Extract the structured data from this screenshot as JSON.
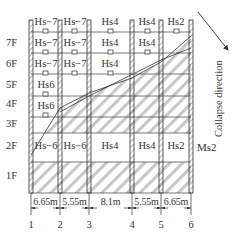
{
  "figure": {
    "collapse_label": "Collapse direction",
    "ms_label": "Ms2",
    "floors": [
      {
        "label": "7F",
        "y": 37
      },
      {
        "label": "6F",
        "y": 58
      },
      {
        "label": "5F",
        "y": 79
      },
      {
        "label": "4F",
        "y": 98
      },
      {
        "label": "3F",
        "y": 118
      },
      {
        "label": "2F",
        "y": 140
      },
      {
        "label": "1F",
        "y": 170
      }
    ],
    "axes": [
      {
        "label": "1",
        "x": 31
      },
      {
        "label": "2",
        "x": 60
      },
      {
        "label": "3",
        "x": 89
      },
      {
        "label": "4",
        "x": 132
      },
      {
        "label": "5",
        "x": 161
      },
      {
        "label": "6",
        "x": 191
      }
    ],
    "spans": [
      {
        "label": "6.65m",
        "x": 45.5
      },
      {
        "label": "5.55m",
        "x": 74.5
      },
      {
        "label": "8.1m",
        "x": 110.5
      },
      {
        "label": "5.55m",
        "x": 146.5
      },
      {
        "label": "6.65m",
        "x": 176
      }
    ],
    "rooms": [
      {
        "label": "Hs−7",
        "x": 46,
        "y": 16
      },
      {
        "label": "Hs−7",
        "x": 75,
        "y": 16
      },
      {
        "label": "Hs4",
        "x": 110,
        "y": 16
      },
      {
        "label": "Hs4",
        "x": 147,
        "y": 16
      },
      {
        "label": "Hs2",
        "x": 176,
        "y": 16
      },
      {
        "label": "Hs−7",
        "x": 46,
        "y": 37
      },
      {
        "label": "Hs−7",
        "x": 75,
        "y": 37
      },
      {
        "label": "Hs4",
        "x": 110,
        "y": 37
      },
      {
        "label": "Hs4",
        "x": 147,
        "y": 37
      },
      {
        "label": "Hs−7",
        "x": 46,
        "y": 58
      },
      {
        "label": "Hs−7",
        "x": 75,
        "y": 58
      },
      {
        "label": "Hs4",
        "x": 110,
        "y": 58
      },
      {
        "label": "Hs6",
        "x": 46,
        "y": 79
      },
      {
        "label": "Hs6",
        "x": 46,
        "y": 100
      },
      {
        "label": "Hs−6",
        "x": 46,
        "y": 140
      },
      {
        "label": "Hs−6",
        "x": 75,
        "y": 140
      },
      {
        "label": "Hs4",
        "x": 110,
        "y": 140
      },
      {
        "label": "Hs4",
        "x": 147,
        "y": 140
      },
      {
        "label": "Hs2",
        "x": 176,
        "y": 140
      }
    ]
  }
}
